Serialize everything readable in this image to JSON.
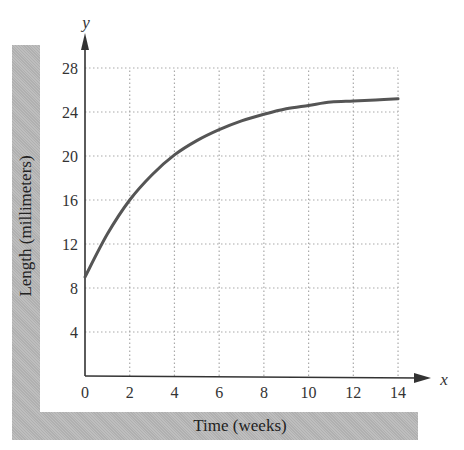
{
  "chart_data": {
    "type": "line",
    "title": "",
    "xlabel": "Time (weeks)",
    "ylabel": "Length (millimeters)",
    "x_axis_name": "x",
    "y_axis_name": "y",
    "xlim": [
      0,
      14
    ],
    "ylim": [
      0,
      28
    ],
    "x_ticks": [
      0,
      2,
      4,
      6,
      8,
      10,
      12,
      14
    ],
    "y_ticks": [
      4,
      8,
      12,
      16,
      20,
      24,
      28
    ],
    "grid": true,
    "legend": null,
    "series": [
      {
        "name": "Length",
        "x": [
          0,
          1,
          2,
          3,
          4,
          5,
          6,
          7,
          8,
          9,
          10,
          11,
          12,
          13,
          14
        ],
        "y": [
          9.0,
          12.9,
          16.0,
          18.3,
          20.1,
          21.4,
          22.4,
          23.2,
          23.8,
          24.3,
          24.6,
          24.9,
          25.0,
          25.1,
          25.2
        ]
      }
    ]
  },
  "colors": {
    "curve": "#555555",
    "axis": "#333333",
    "grid": "#aaaaaa",
    "band": "#b9b9b9"
  }
}
